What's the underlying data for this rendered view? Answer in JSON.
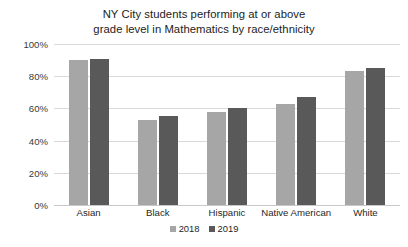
{
  "chart_data": {
    "type": "bar",
    "title": "NY City students performing at or above grade level in Mathematics by race/ethnicity",
    "title_lines": [
      "NY City students performing at or above",
      "grade level in Mathematics by race/ethnicity"
    ],
    "xlabel": "",
    "ylabel": "",
    "categories": [
      "Asian",
      "Black",
      "Hispanic",
      "Native American",
      "White"
    ],
    "series": [
      {
        "name": "2018",
        "color": "#a6a6a6",
        "values": [
          90,
          53,
          58,
          63,
          83
        ]
      },
      {
        "name": "2019",
        "color": "#595959",
        "values": [
          91,
          55,
          60,
          67,
          85
        ]
      }
    ],
    "ylim": [
      0,
      100
    ],
    "ytick_values": [
      0,
      20,
      40,
      60,
      80,
      100
    ],
    "ytick_labels": [
      "0%",
      "20%",
      "40%",
      "60%",
      "80%",
      "100%"
    ],
    "grid": true,
    "grid_color": "#d9d9d9",
    "legend_position": "bottom",
    "background": "#ffffff"
  }
}
